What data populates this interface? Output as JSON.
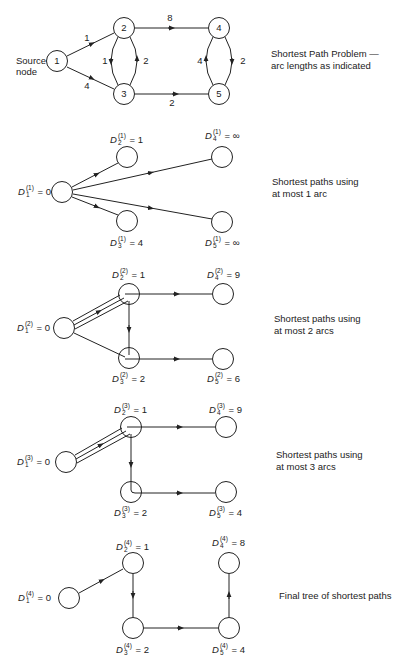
{
  "panels": [
    {
      "id": "problem",
      "caption": "Shortest Path Problem —\narc lengths as indicated",
      "source_label": "Source\nnode",
      "nodes": [
        "1",
        "2",
        "3",
        "4",
        "5"
      ],
      "arcs": [
        {
          "from": "1",
          "to": "2",
          "length": "1"
        },
        {
          "from": "1",
          "to": "3",
          "length": "4"
        },
        {
          "from": "2",
          "to": "3",
          "length": "1"
        },
        {
          "from": "3",
          "to": "2",
          "length": "2"
        },
        {
          "from": "2",
          "to": "4",
          "length": "8"
        },
        {
          "from": "3",
          "to": "5",
          "length": "2"
        },
        {
          "from": "4",
          "to": "5",
          "length": "2"
        },
        {
          "from": "5",
          "to": "4",
          "length": "4"
        }
      ]
    },
    {
      "id": "iter1",
      "caption": "Shortest paths using\nat most 1 arc",
      "h": "1",
      "labels": {
        "n1": "0",
        "n2": "1",
        "n3": "4",
        "n4": "∞",
        "n5": "∞"
      }
    },
    {
      "id": "iter2",
      "caption": "Shortest paths using\nat most 2 arcs",
      "h": "2",
      "labels": {
        "n1": "0",
        "n2": "1",
        "n3": "2",
        "n4": "9",
        "n5": "6"
      }
    },
    {
      "id": "iter3",
      "caption": "Shortest paths using\nat most 3 arcs",
      "h": "3",
      "labels": {
        "n1": "0",
        "n2": "1",
        "n3": "2",
        "n4": "9",
        "n5": "4"
      }
    },
    {
      "id": "final",
      "caption": "Final tree of shortest paths",
      "h": "4",
      "labels": {
        "n1": "0",
        "n2": "1",
        "n3": "2",
        "n4": "8",
        "n5": "4"
      }
    }
  ],
  "symbols": {
    "D": "D",
    "eq": "="
  }
}
